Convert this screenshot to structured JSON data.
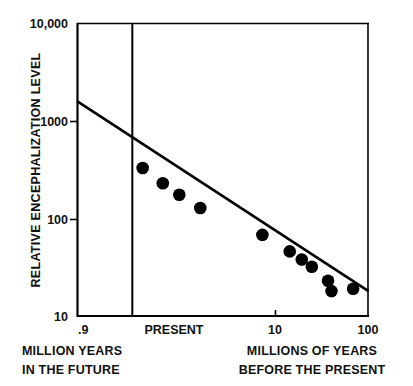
{
  "chart_data": {
    "type": "scatter",
    "title": "",
    "subtitle": "",
    "xlabel": "MILLIONS OF YEARS BEFORE THE PRESENT",
    "ylabel": "RELATIVE ENCEPHALIZATION LEVEL",
    "xscale": "log",
    "yscale": "log",
    "xlim": [
      0.9,
      100
    ],
    "ylim": [
      10,
      10000
    ],
    "grid": false,
    "legend": null,
    "x_tick_labels": [
      ".9",
      "PRESENT",
      "10",
      "100"
    ],
    "x_tick_values": [
      0.9,
      2.2,
      10,
      100
    ],
    "y_tick_labels": [
      "10,000",
      "1000",
      "100",
      "10"
    ],
    "y_tick_values": [
      10000,
      1000,
      100,
      10
    ],
    "axis_note_left": "MILLION YEARS IN THE FUTURE",
    "axis_note_right": "MILLIONS OF YEARS BEFORE THE PRESENT",
    "reference_line": {
      "label": "PRESENT",
      "x": 2.2,
      "orientation": "vertical"
    },
    "series": [
      {
        "name": "encephalization data points",
        "marker": "filled-circle",
        "color": "#000000",
        "points": [
          {
            "x": 2.6,
            "y": 330
          },
          {
            "x": 3.6,
            "y": 230
          },
          {
            "x": 4.7,
            "y": 175
          },
          {
            "x": 6.6,
            "y": 128
          },
          {
            "x": 18.0,
            "y": 68
          },
          {
            "x": 28.0,
            "y": 46
          },
          {
            "x": 34.0,
            "y": 38
          },
          {
            "x": 40.0,
            "y": 32
          },
          {
            "x": 52.0,
            "y": 23
          },
          {
            "x": 55.0,
            "y": 18
          },
          {
            "x": 78.0,
            "y": 19
          }
        ]
      }
    ],
    "trend_line": {
      "name": "fitted regression line",
      "color": "#000000",
      "points": [
        {
          "x": 0.9,
          "y": 1600
        },
        {
          "x": 100,
          "y": 18
        }
      ]
    }
  },
  "labels": {
    "y_axis_title": "RELATIVE ENCEPHALIZATION LEVEL",
    "y_10000": "10,000",
    "y_1000": "1000",
    "y_100": "100",
    "y_10": "10",
    "x_09": ".9",
    "x_present": "PRESENT",
    "x_10": "10",
    "x_100": "100",
    "caption_left_line1": "MILLION YEARS",
    "caption_left_line2": "IN THE FUTURE",
    "caption_right_line1": "MILLIONS OF YEARS",
    "caption_right_line2": "BEFORE THE PRESENT"
  },
  "colors": {
    "background": "#ffffff",
    "ink": "#000000",
    "marker": "#000000"
  }
}
